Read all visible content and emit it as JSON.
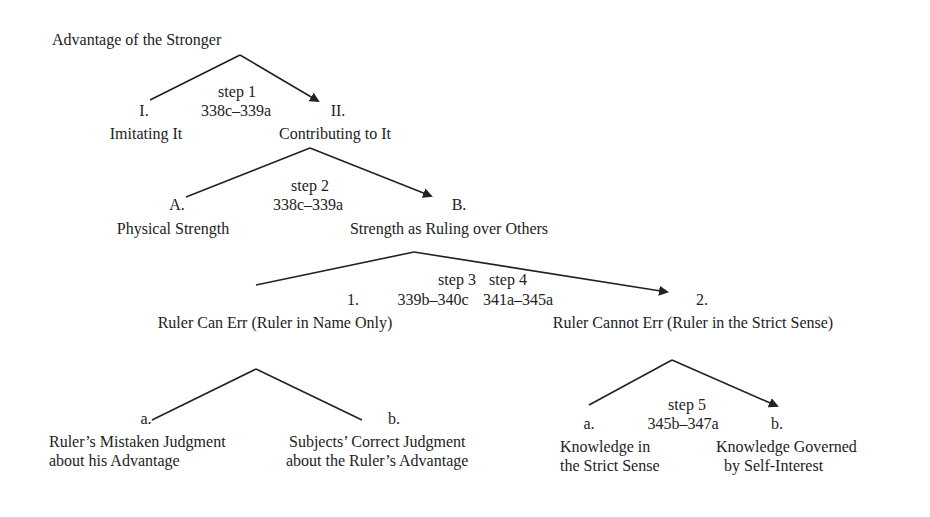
{
  "diagram": {
    "root": "Advantage of the Stronger",
    "level1": {
      "step_label": "step 1",
      "step_ref": "338c–339a",
      "left": {
        "marker": "I.",
        "label": "Imitating It"
      },
      "right": {
        "marker": "II.",
        "label": "Contributing to It"
      }
    },
    "level2": {
      "step_label": "step 2",
      "step_ref": "338c–339a",
      "left": {
        "marker": "A.",
        "label": "Physical Strength"
      },
      "right": {
        "marker": "B.",
        "label": "Strength as Ruling over Others"
      }
    },
    "level3": {
      "step3_label": "step 3",
      "step3_ref": "339b–340c",
      "step4_label": "step 4",
      "step4_ref": "341a–345a",
      "left": {
        "marker": "1.",
        "label": "Ruler Can Err  (Ruler in Name Only)"
      },
      "right": {
        "marker": "2.",
        "label": "Ruler Cannot Err (Ruler in the Strict Sense)"
      }
    },
    "level4_left": {
      "left": {
        "marker": "a.",
        "line1": "Ruler’s Mistaken Judgment",
        "line2": "about his Advantage"
      },
      "right": {
        "marker": "b.",
        "line1": "Subjects’ Correct Judgment",
        "line2": "about the Ruler’s Advantage"
      }
    },
    "level4_right": {
      "step_label": "step 5",
      "step_ref": "345b–347a",
      "left": {
        "marker": "a.",
        "line1": "Knowledge in",
        "line2": "the Strict Sense"
      },
      "right": {
        "marker": "b.",
        "line1": "Knowledge Governed",
        "line2": "by Self-Interest"
      }
    }
  },
  "colors": {
    "line": "#222222",
    "text": "#222222",
    "background": "#ffffff"
  }
}
